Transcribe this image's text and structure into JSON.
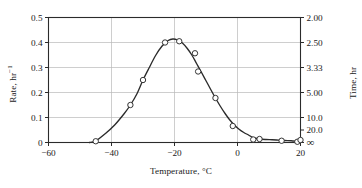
{
  "chart_data": {
    "type": "line",
    "title": "",
    "xlabel": "Temperature, °C",
    "ylabel": "Rate, hr",
    "ylabel_exponent": "−1",
    "y2label": "Time, hr",
    "xlim": [
      -60,
      20
    ],
    "ylim": [
      0,
      0.5
    ],
    "grid": true,
    "legend": null,
    "xticks": [
      -60,
      -40,
      -20,
      0,
      20
    ],
    "xticklabels": [
      "−60",
      "−40",
      "−20",
      "0",
      "20"
    ],
    "yticks": [
      0,
      0.1,
      0.2,
      0.3,
      0.4,
      0.5
    ],
    "yticklabels": [
      "0",
      "0.1",
      "0.2",
      "0.3",
      "0.4",
      "0.5"
    ],
    "y2ticks": [
      0.5,
      0.4,
      0.3,
      0.2,
      0.1,
      0.05,
      0.0
    ],
    "y2ticklabels": [
      "2.00",
      "2.50",
      "3.33",
      "5.00",
      "10.0",
      "20.0",
      "∞"
    ],
    "y2_relation": "time = 1 / rate",
    "marker": "open-circle",
    "line_color": "#2b2b2b",
    "marker_face_color": "#ffffff",
    "grid_color": "#b9b9b9",
    "axis_color": "#2b2b2b",
    "series": [
      {
        "name": "Rate vs Temperature",
        "x": [
          -45,
          -34,
          -30,
          -23,
          -18.5,
          -13.5,
          -12.5,
          -7,
          -1.5,
          5,
          7,
          14,
          19,
          20
        ],
        "values": [
          0.005,
          0.15,
          0.25,
          0.4,
          0.405,
          0.357,
          0.284,
          0.178,
          0.066,
          0.012,
          0.014,
          0.007,
          0.003,
          0.01
        ]
      }
    ],
    "curve_x": [
      -47,
      -45,
      -42,
      -39,
      -36,
      -34,
      -32,
      -30,
      -28,
      -26,
      -24,
      -22,
      -20.5,
      -19,
      -17.5,
      -16,
      -14.5,
      -13,
      -11.5,
      -10,
      -8.5,
      -7,
      -5.5,
      -4,
      -2.5,
      -1,
      0.5,
      2,
      3.5,
      5,
      7,
      9,
      11,
      13,
      15,
      17,
      19,
      20
    ],
    "curve_y": [
      0.0,
      0.006,
      0.035,
      0.07,
      0.115,
      0.15,
      0.193,
      0.25,
      0.3,
      0.348,
      0.385,
      0.408,
      0.414,
      0.41,
      0.398,
      0.377,
      0.35,
      0.316,
      0.282,
      0.247,
      0.212,
      0.178,
      0.146,
      0.117,
      0.091,
      0.07,
      0.053,
      0.04,
      0.03,
      0.019,
      0.014,
      0.012,
      0.011,
      0.0095,
      0.008,
      0.007,
      0.005,
      0.004
    ]
  }
}
